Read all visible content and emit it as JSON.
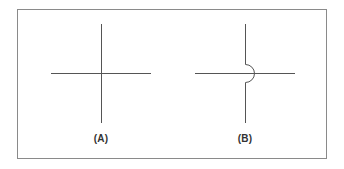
{
  "figure": {
    "panels": [
      {
        "id": "A",
        "label": "(A)",
        "description": "Two lines crossing (connected junction)"
      },
      {
        "id": "B",
        "label": "(B)",
        "description": "Vertical line hops over horizontal line with a semicircular bridge (no connection)"
      }
    ],
    "colors": {
      "line": "#555555",
      "frame": "#8a8a8a",
      "label": "#333333"
    }
  }
}
